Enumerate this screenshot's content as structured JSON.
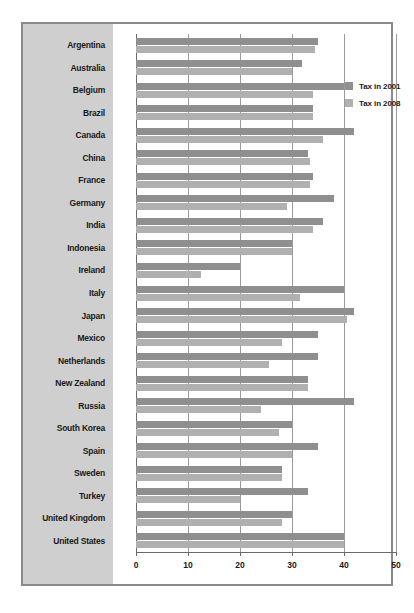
{
  "chart_data": {
    "type": "bar",
    "orientation": "horizontal",
    "title": "",
    "xlabel": "",
    "ylabel": "",
    "xlim": [
      0,
      50
    ],
    "xticks": [
      0,
      10,
      20,
      30,
      40,
      50
    ],
    "xtick_labels": [
      "0",
      "10",
      "20",
      "30",
      "40",
      "50"
    ],
    "grid": true,
    "grid_axis": "x",
    "legend_position": "center-right",
    "categories": [
      "Argentina",
      "Australia",
      "Belgium",
      "Brazil",
      "Canada",
      "China",
      "France",
      "Germany",
      "India",
      "Indonesia",
      "Ireland",
      "Italy",
      "Japan",
      "Mexico",
      "Netherlands",
      "New Zealand",
      "Russia",
      "South Korea",
      "Spain",
      "Sweden",
      "Turkey",
      "United Kingdom",
      "United States"
    ],
    "series": [
      {
        "name": "Tax in 2001",
        "color": "#8f8f8f",
        "values": [
          35,
          32,
          40,
          34,
          42,
          33,
          34,
          38,
          36,
          30,
          20,
          40,
          42,
          35,
          35,
          33,
          42,
          30,
          35,
          28,
          33,
          30,
          40
        ]
      },
      {
        "name": "Tax in 2008",
        "color": "#b0b0b0",
        "values": [
          34.5,
          30,
          34,
          34,
          36,
          33.5,
          33.5,
          29,
          34,
          30,
          12.5,
          31.5,
          40.5,
          28,
          25.5,
          33,
          24,
          27.5,
          30,
          28,
          20,
          28,
          40
        ]
      }
    ]
  },
  "legend": {
    "items": [
      {
        "label": "Tax in 2001",
        "color": "#8f8f8f"
      },
      {
        "label": "Tax in 2008",
        "color": "#b0b0b0"
      }
    ]
  },
  "colors": {
    "series_2001": "#8f8f8f",
    "series_2008": "#b0b0b0",
    "label_panel_background": "#cfcfcf",
    "plot_background": "#ffffff",
    "frame_border": "#8a8a8a",
    "gridline": "#9a9a9a",
    "axis": "#6a6a6a",
    "text": "#1a1a1a"
  }
}
